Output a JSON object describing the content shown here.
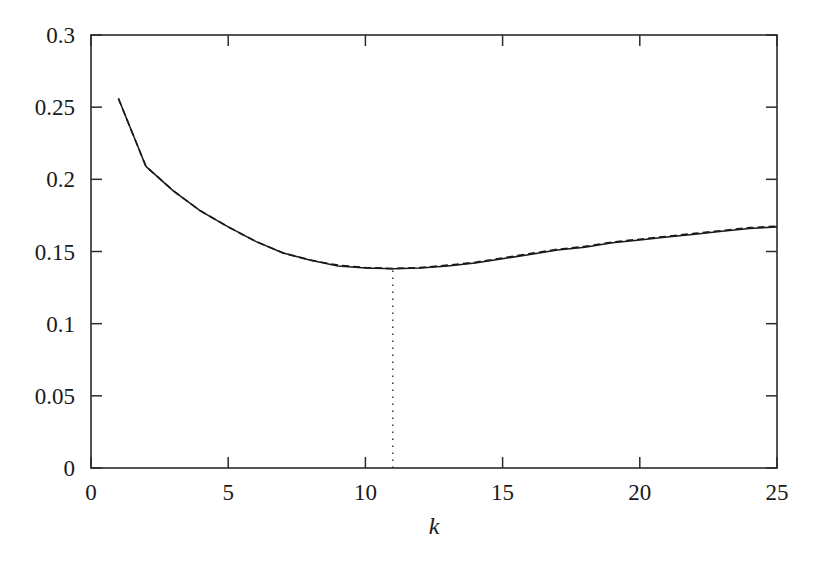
{
  "chart_data": {
    "type": "line",
    "title": "",
    "subtitle": "",
    "xlabel": "k",
    "ylabel": "",
    "xlim": [
      0,
      25
    ],
    "ylim": [
      0,
      0.3
    ],
    "grid": false,
    "legend": "none",
    "annotations": [
      {
        "name": "minimum-marker",
        "type": "vertical-dotted-line",
        "x": 11,
        "y_from": 0,
        "y_to": 0.138,
        "style": "dotted"
      }
    ],
    "xticks": [
      {
        "value": 0,
        "label": "0"
      },
      {
        "value": 5,
        "label": "5"
      },
      {
        "value": 10,
        "label": "10"
      },
      {
        "value": 15,
        "label": "15"
      },
      {
        "value": 20,
        "label": "20"
      },
      {
        "value": 25,
        "label": "25"
      }
    ],
    "yticks": [
      {
        "value": 0,
        "label": "0"
      },
      {
        "value": 0.05,
        "label": "0.05"
      },
      {
        "value": 0.1,
        "label": "0.1"
      },
      {
        "value": 0.15,
        "label": "0.15"
      },
      {
        "value": 0.2,
        "label": "0.2"
      },
      {
        "value": 0.25,
        "label": "0.25"
      },
      {
        "value": 0.3,
        "label": "0.3"
      }
    ],
    "x": [
      1,
      2,
      3,
      4,
      5,
      6,
      7,
      8,
      9,
      10,
      11,
      12,
      13,
      14,
      15,
      16,
      17,
      18,
      19,
      20,
      21,
      22,
      23,
      24,
      25
    ],
    "series": [
      {
        "name": "solid-curve",
        "style": "solid",
        "color": "#1a1a1a",
        "values": [
          0.256,
          0.209,
          0.192,
          0.178,
          0.167,
          0.157,
          0.149,
          0.144,
          0.14,
          0.1385,
          0.138,
          0.1385,
          0.14,
          0.142,
          0.145,
          0.148,
          0.151,
          0.153,
          0.156,
          0.158,
          0.16,
          0.162,
          0.164,
          0.166,
          0.167
        ]
      },
      {
        "name": "dashed-curve",
        "style": "dashed",
        "color": "#1a1a1a",
        "values": [
          0.256,
          0.209,
          0.192,
          0.178,
          0.167,
          0.157,
          0.149,
          0.144,
          0.1405,
          0.1388,
          0.1382,
          0.1388,
          0.1405,
          0.1425,
          0.1455,
          0.1485,
          0.1515,
          0.1535,
          0.1565,
          0.1585,
          0.1605,
          0.1625,
          0.1645,
          0.1665,
          0.1675
        ]
      }
    ],
    "minimum": {
      "x": 11,
      "y": 0.138
    }
  },
  "axes": {
    "frame_color": "#2b2b2b",
    "background": "#ffffff"
  }
}
